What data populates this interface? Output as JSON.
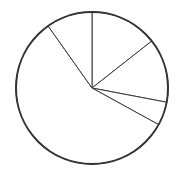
{
  "chart_data": {
    "type": "pie",
    "title": "",
    "legend": [],
    "labels": [
      "",
      "",
      "",
      "",
      ""
    ],
    "start_angle_deg": 0,
    "direction": "clockwise",
    "values": [
      14.4,
      13.6,
      5.0,
      57.2,
      9.8
    ],
    "colors": {
      "fill": "#ffffff",
      "stroke": "#3a3a3a",
      "outline": "#333333"
    },
    "center": [
      92,
      88
    ],
    "radius": 76
  }
}
